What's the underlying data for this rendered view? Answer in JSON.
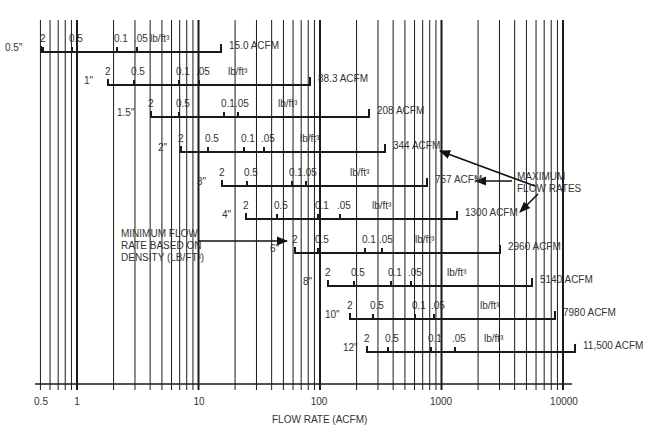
{
  "chart_data": {
    "type": "line",
    "title": "",
    "xlabel": "FLOW RATE (ACFM)",
    "ylabel": "",
    "xscale": "log",
    "xlim": [
      0.5,
      10000
    ],
    "x_ticks": [
      "0.5",
      "1",
      "10",
      "100",
      "1000",
      "10000"
    ],
    "grid": true,
    "density_unit": "lb/ft³",
    "density_scale_labels": [
      "2",
      "0.5",
      "0.1",
      ".05"
    ],
    "series": [
      {
        "name": "0.5\"",
        "min_flow_acfm": 0.5,
        "max_flow_acfm": 15.0,
        "max_label": "15.0 ACFM"
      },
      {
        "name": "1\"",
        "min_flow_acfm": 2,
        "max_flow_acfm": 88.3,
        "max_label": "88.3 ACFM"
      },
      {
        "name": "1.5\"",
        "min_flow_acfm": 4.3,
        "max_flow_acfm": 208,
        "max_label": "208 ACFM"
      },
      {
        "name": "2\"",
        "min_flow_acfm": 7.5,
        "max_flow_acfm": 344,
        "max_label": "344 ACFM"
      },
      {
        "name": "3\"",
        "min_flow_acfm": 16,
        "max_flow_acfm": 757,
        "max_label": "757 ACFM"
      },
      {
        "name": "4\"",
        "min_flow_acfm": 25,
        "max_flow_acfm": 1300,
        "max_label": "1300 ACFM"
      },
      {
        "name": "6\"",
        "min_flow_acfm": 65,
        "max_flow_acfm": 2960,
        "max_label": "2960 ACFM"
      },
      {
        "name": "8\"",
        "min_flow_acfm": 120,
        "max_flow_acfm": 5140,
        "max_label": "5140 ACFM"
      },
      {
        "name": "10\"",
        "min_flow_acfm": 180,
        "max_flow_acfm": 7980,
        "max_label": "7980 ACFM"
      },
      {
        "name": "12\"",
        "min_flow_acfm": 250,
        "max_flow_acfm": 11500,
        "max_label": "11,500 ACFM"
      }
    ],
    "annotations": [
      "MAXIMUM FLOW RATES",
      "MINIMUM FLOW RATE BASED ON DENSITY (LB/FT³)"
    ]
  },
  "rows": [
    {
      "size": "0.5\"",
      "y": 52,
      "x0": 41,
      "x1": 221,
      "max_label": "15.0 ACFM",
      "ticks": [
        {
          "t": "2",
          "x": 43
        },
        {
          "t": "0.5",
          "x": 72
        },
        {
          "t": "0.1",
          "x": 117
        },
        {
          "t": ".05",
          "x": 137
        }
      ],
      "unit_x": 150,
      "size_x": 5
    },
    {
      "size": "1\"",
      "y": 85,
      "x0": 108,
      "x1": 310,
      "max_label": "88.3 ACFM",
      "ticks": [
        {
          "t": "2",
          "x": 108
        },
        {
          "t": "0.5",
          "x": 134
        },
        {
          "t": "0.1",
          "x": 179
        },
        {
          "t": ".05",
          "x": 199
        }
      ],
      "unit_x": 228,
      "size_x": 84
    },
    {
      "size": "1.5\"",
      "y": 117,
      "x0": 151,
      "x1": 369,
      "max_label": "208 ACFM",
      "ticks": [
        {
          "t": "2",
          "x": 151
        },
        {
          "t": "0.5",
          "x": 179
        },
        {
          "t": "0.1",
          "x": 224
        },
        {
          "t": ".05",
          "x": 238
        }
      ],
      "unit_x": 278,
      "size_x": 117
    },
    {
      "size": "2\"",
      "y": 152,
      "x0": 181,
      "x1": 385,
      "max_label": "344 ACFM",
      "ticks": [
        {
          "t": "2",
          "x": 181
        },
        {
          "t": "0.5",
          "x": 208
        },
        {
          "t": "0.1",
          "x": 244
        },
        {
          "t": ".05",
          "x": 264
        }
      ],
      "unit_x": 300,
      "size_x": 158
    },
    {
      "size": "3\"",
      "y": 186,
      "x0": 222,
      "x1": 427,
      "max_label": "757 ACFM",
      "ticks": [
        {
          "t": "2",
          "x": 222
        },
        {
          "t": "0.5",
          "x": 247
        },
        {
          "t": "0.1",
          "x": 292
        },
        {
          "t": ".05",
          "x": 306
        }
      ],
      "unit_x": 350,
      "size_x": 197
    },
    {
      "size": "4\"",
      "y": 219,
      "x0": 246,
      "x1": 457,
      "max_label": "1300 ACFM",
      "ticks": [
        {
          "t": "2",
          "x": 246
        },
        {
          "t": "0.5",
          "x": 277
        },
        {
          "t": "0.1",
          "x": 318
        },
        {
          "t": ".05",
          "x": 340
        }
      ],
      "unit_x": 372,
      "size_x": 222
    },
    {
      "size": "6\"",
      "y": 253,
      "x0": 295,
      "x1": 500,
      "max_label": "2960 ACFM",
      "ticks": [
        {
          "t": "2",
          "x": 295
        },
        {
          "t": "0.5",
          "x": 318
        },
        {
          "t": "0.1",
          "x": 365
        },
        {
          "t": ".05",
          "x": 382
        }
      ],
      "unit_x": 415,
      "size_x": 270
    },
    {
      "size": "8\"",
      "y": 286,
      "x0": 328,
      "x1": 532,
      "max_label": "5140 ACFM",
      "ticks": [
        {
          "t": "2",
          "x": 328
        },
        {
          "t": "0.5",
          "x": 354
        },
        {
          "t": "0.1",
          "x": 391
        },
        {
          "t": ".05",
          "x": 411
        }
      ],
      "unit_x": 447,
      "size_x": 303
    },
    {
      "size": "10\"",
      "y": 319,
      "x0": 350,
      "x1": 555,
      "max_label": "7980 ACFM",
      "ticks": [
        {
          "t": "2",
          "x": 350
        },
        {
          "t": "0.5",
          "x": 373
        },
        {
          "t": "0.1",
          "x": 415
        },
        {
          "t": ".05",
          "x": 434
        }
      ],
      "unit_x": 480,
      "size_x": 325
    },
    {
      "size": "12\"",
      "y": 352,
      "x0": 367,
      "x1": 575,
      "max_label": "11,500 ACFM",
      "ticks": [
        {
          "t": "2",
          "x": 367
        },
        {
          "t": "0.5",
          "x": 388
        },
        {
          "t": "0.1",
          "x": 431
        },
        {
          "t": ".05",
          "x": 455
        }
      ],
      "unit_x": 484,
      "size_x": 343
    }
  ],
  "axis": {
    "y": 384,
    "x_start": 35,
    "x_end": 572,
    "major": [
      {
        "label": "0.5",
        "x": 41
      },
      {
        "label": "1",
        "x": 77
      },
      {
        "label": "10",
        "x": 199
      },
      {
        "label": "100",
        "x": 319
      },
      {
        "label": "1000",
        "x": 441
      },
      {
        "label": "10000",
        "x": 564
      }
    ]
  },
  "labels": {
    "xlabel": "FLOW RATE (ACFM)",
    "max_annotation_line1": "MAXIMUM",
    "max_annotation_line2": "FLOW RATES",
    "min_annotation_line1": "MINIMUM FLOW",
    "min_annotation_line2": "RATE BASED ON",
    "min_annotation_line3": "DENSITY (LB/FT³)",
    "unit": "lb/ft³"
  }
}
